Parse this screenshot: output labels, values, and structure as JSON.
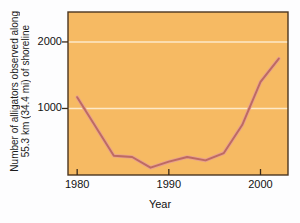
{
  "chart_data": {
    "type": "line",
    "title": "",
    "xlabel": "Year",
    "ylabel": "Number of alligators observed along 55.3 km (34.4 mi) of shoreline",
    "ylabel_line1": "Number of alligators observed along",
    "ylabel_line2": "55.3 km (34.4 mi) of shoreline",
    "xlim": [
      1979,
      2003
    ],
    "ylim": [
      0,
      2450
    ],
    "xticks": [
      1980,
      1990,
      2000
    ],
    "xtick_labels": [
      "1980",
      "1990",
      "2000"
    ],
    "yticks": [
      1000,
      2000
    ],
    "ytick_labels": [
      "1000",
      "2000"
    ],
    "gridlines": {
      "horizontal": [
        1000,
        2000
      ],
      "vertical": [],
      "color": "#fde9c8"
    },
    "legend": null,
    "series": [
      {
        "name": "Alligators observed",
        "x": [
          1980,
          1984,
          1986,
          1988,
          1990,
          1992,
          1994,
          1996,
          1998,
          2000,
          2002
        ],
        "values": [
          1170,
          290,
          270,
          110,
          200,
          270,
          220,
          330,
          750,
          1400,
          1750
        ],
        "color": "#bd6a62"
      }
    ],
    "plot_background": "#f6ba63",
    "figure_background": "#fdfdfe",
    "axis_color": "#3a2a1a",
    "line_color": "#bd6a62",
    "line_highlight": "#e8a090"
  },
  "axes": {
    "y_title_line1": "Number of alligators observed along",
    "y_title_line2": "55.3 km (34.4 mi) of shoreline",
    "x_title": "Year",
    "ytick_1000": "1000",
    "ytick_2000": "2000",
    "xtick_1980": "1980",
    "xtick_1990": "1990",
    "xtick_2000": "2000"
  }
}
